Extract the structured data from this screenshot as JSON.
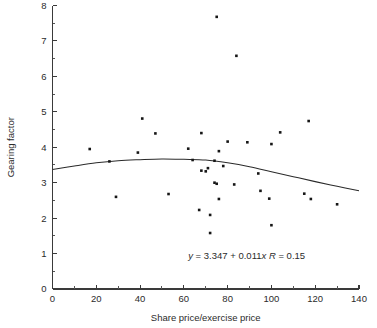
{
  "chart_data": {
    "type": "scatter",
    "title": "",
    "subtitle": "",
    "xlabel": "Share price/exercise price",
    "ylabel": "Gearing factor",
    "xlim": [
      0,
      140
    ],
    "ylim": [
      0,
      8
    ],
    "xticks": [
      0,
      20,
      40,
      60,
      80,
      100,
      120,
      140
    ],
    "yticks": [
      0,
      1,
      2,
      3,
      4,
      5,
      6,
      7,
      8
    ],
    "xtick_labels": [
      "0",
      "20",
      "40",
      "60",
      "80",
      "100",
      "120",
      "140"
    ],
    "ytick_labels": [
      "0",
      "1",
      "2",
      "3",
      "4",
      "5",
      "6",
      "7",
      "8"
    ],
    "minor_ticks": true,
    "grid": false,
    "legend": false,
    "legend_position": "none",
    "marker": "square",
    "marker_color": "#161616",
    "points": [
      {
        "x": 17,
        "y": 3.95
      },
      {
        "x": 26,
        "y": 3.6
      },
      {
        "x": 29,
        "y": 2.6
      },
      {
        "x": 39,
        "y": 3.85
      },
      {
        "x": 41,
        "y": 4.81
      },
      {
        "x": 47,
        "y": 4.39
      },
      {
        "x": 53,
        "y": 2.68
      },
      {
        "x": 62,
        "y": 3.96
      },
      {
        "x": 64,
        "y": 3.64
      },
      {
        "x": 67,
        "y": 2.23
      },
      {
        "x": 68,
        "y": 4.4
      },
      {
        "x": 68,
        "y": 3.34
      },
      {
        "x": 70,
        "y": 3.32
      },
      {
        "x": 71,
        "y": 3.41
      },
      {
        "x": 72,
        "y": 2.09
      },
      {
        "x": 72,
        "y": 1.58
      },
      {
        "x": 74,
        "y": 3.62
      },
      {
        "x": 74,
        "y": 3.0
      },
      {
        "x": 75,
        "y": 2.97
      },
      {
        "x": 75,
        "y": 7.68
      },
      {
        "x": 76,
        "y": 3.89
      },
      {
        "x": 76,
        "y": 2.54
      },
      {
        "x": 78,
        "y": 3.47
      },
      {
        "x": 80,
        "y": 4.16
      },
      {
        "x": 83,
        "y": 2.95
      },
      {
        "x": 84,
        "y": 6.58
      },
      {
        "x": 89,
        "y": 4.14
      },
      {
        "x": 94,
        "y": 3.26
      },
      {
        "x": 95,
        "y": 2.77
      },
      {
        "x": 99,
        "y": 2.55
      },
      {
        "x": 100,
        "y": 4.09
      },
      {
        "x": 100,
        "y": 1.8
      },
      {
        "x": 104,
        "y": 4.42
      },
      {
        "x": 115,
        "y": 2.69
      },
      {
        "x": 117,
        "y": 4.74
      },
      {
        "x": 118,
        "y": 2.54
      },
      {
        "x": 130,
        "y": 2.39
      }
    ],
    "fit_curve": {
      "type": "quadratic",
      "description": "fitted trend line",
      "points": [
        {
          "x": 0,
          "y": 3.37
        },
        {
          "x": 10,
          "y": 3.47
        },
        {
          "x": 20,
          "y": 3.56
        },
        {
          "x": 30,
          "y": 3.62
        },
        {
          "x": 40,
          "y": 3.65
        },
        {
          "x": 50,
          "y": 3.67
        },
        {
          "x": 60,
          "y": 3.66
        },
        {
          "x": 70,
          "y": 3.64
        },
        {
          "x": 80,
          "y": 3.56
        },
        {
          "x": 90,
          "y": 3.45
        },
        {
          "x": 100,
          "y": 3.31
        },
        {
          "x": 110,
          "y": 3.17
        },
        {
          "x": 120,
          "y": 3.03
        },
        {
          "x": 130,
          "y": 2.9
        },
        {
          "x": 140,
          "y": 2.77
        }
      ]
    },
    "annotations": [
      {
        "name": "regression-equation",
        "text": "y = 3.347 + 0.011x  R = 0.15",
        "parts": {
          "y_symbol": "y",
          "equals_1": " = ",
          "intercept": "3.347",
          "plus": " + ",
          "slope": "0.011",
          "x_symbol": "x",
          "gap": "  ",
          "r_symbol": "R",
          "equals_2": " = ",
          "r_value": "0.15"
        },
        "x": 62,
        "y": 0.85
      }
    ]
  }
}
